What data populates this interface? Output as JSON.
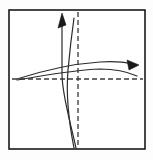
{
  "figure": {
    "title": "Hand-drawn coordinate sketch with two curve pairs",
    "caption": "",
    "background_color": "#fdfdfd",
    "panel_color": "#ffffff",
    "ink_color": "#2b2b2b",
    "frame": {
      "name": "panel-border",
      "x": 9,
      "y": 10,
      "width": 136,
      "height": 139,
      "stroke_color": "#1a1a1a",
      "stroke_width": 1.6
    },
    "axes": {
      "style": "dashed",
      "dash_pattern": "5 3",
      "stroke_color": "#3a3a3a",
      "stroke_width": 1.3,
      "horizontal": {
        "label": "horizontal-dashed-axis",
        "y": 79,
        "x_start": 12,
        "x_end": 143
      },
      "vertical": {
        "label": "vertical-dashed-axis",
        "x": 78,
        "y_start": 12,
        "y_end": 147
      },
      "origin": {
        "x": 78,
        "y": 79
      }
    },
    "curves": [
      {
        "name": "steep-curve-outer",
        "orientation": "vertical",
        "description": "Steep S-shaped curve rising from lower area through origin region to upper left, ending in arrowhead",
        "path": "M 76,148 C 70,120 62,95 62,74 C 62,52 62,34 62,18",
        "stroke_color": "#2b2b2b",
        "stroke_width": 1.2,
        "arrow": "up"
      },
      {
        "name": "steep-curve-inner",
        "orientation": "vertical",
        "description": "Second steep curve paired with the first, crossing near the vertical dashed axis",
        "path": "M 74,148 C 68,118 66,94 68,70 C 70,48 72,32 74,18",
        "stroke_color": "#2b2b2b",
        "stroke_width": 1.2,
        "arrow": "none"
      },
      {
        "name": "shallow-curve-upper",
        "orientation": "horizontal",
        "description": "Shallow curve sweeping from the left edge up across the origin toward the right arrowhead",
        "path": "M 17,79 C 45,70 70,64 100,62 C 114,61 124,62 132,64",
        "stroke_color": "#2b2b2b",
        "stroke_width": 1.2,
        "arrow": "right"
      },
      {
        "name": "shallow-curve-lower",
        "orientation": "horizontal",
        "description": "Second shallow curve paired with the first, forming a narrow lens shape",
        "path": "M 17,80 C 48,75 72,70 100,69 C 116,69 128,72 137,76",
        "stroke_color": "#2b2b2b",
        "stroke_width": 1.2,
        "arrow": "none"
      }
    ],
    "arrowheads": [
      {
        "name": "up-arrowhead",
        "direction": "up",
        "tip_x": 62,
        "tip_y": 13,
        "points": "62,13 58,28 66,25",
        "fill_color": "#1a1a1a"
      },
      {
        "name": "right-arrowhead",
        "direction": "right",
        "tip_x": 139,
        "tip_y": 65,
        "points": "139,65 127,60 129,70",
        "fill_color": "#1a1a1a"
      }
    ]
  }
}
